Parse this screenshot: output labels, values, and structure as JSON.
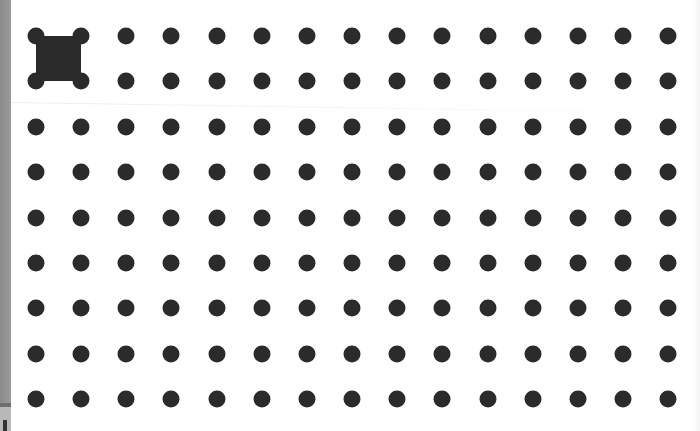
{
  "board": {
    "type": "dot-grid",
    "columns": 15,
    "rows": 9,
    "origin": {
      "x": 36,
      "y": 36
    },
    "spacing": {
      "x": 45.15,
      "y": 45.4
    },
    "dot_color": "#2b2b2b",
    "dot_diameter": 17,
    "filled_boxes": [
      {
        "col": 0,
        "row": 0,
        "color": "#2a2a2a"
      }
    ]
  }
}
